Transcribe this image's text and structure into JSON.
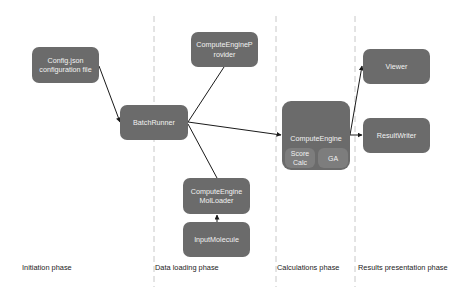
{
  "diagram": {
    "phases": [
      {
        "id": "initiation",
        "label": "Initiation phase"
      },
      {
        "id": "data-loading",
        "label": "Data loading phase"
      },
      {
        "id": "calculations",
        "label": "Calculations phase"
      },
      {
        "id": "results-presentation",
        "label": "Results presentation phase"
      }
    ],
    "nodes": {
      "config": {
        "line1": "Config.json",
        "line2": "configuration file"
      },
      "batch_runner": {
        "label": "BatchRunner"
      },
      "provider": {
        "line1": "ComputeEngineP",
        "line2": "rovider"
      },
      "compute_engine": {
        "label": "ComputeEngine",
        "sub1_line1": "Score",
        "sub1_line2": "Calc",
        "sub2": "GA"
      },
      "viewer": {
        "label": "Viewer"
      },
      "result_writer": {
        "label": "ResultWriter"
      },
      "mol_loader": {
        "line1": "ComputeEngine",
        "line2": "MolLoader"
      },
      "input_molecule": {
        "label": "InputMolecule"
      }
    },
    "edges": [
      {
        "from": "Config.json configuration file",
        "to": "BatchRunner"
      },
      {
        "from": "BatchRunner",
        "to": "ComputeEngineProvider"
      },
      {
        "from": "BatchRunner",
        "to": "ComputeEngine"
      },
      {
        "from": "BatchRunner",
        "to": "ComputeEngine MolLoader"
      },
      {
        "from": "InputMolecule",
        "to": "ComputeEngine MolLoader"
      },
      {
        "from": "ComputeEngine",
        "to": "Viewer"
      },
      {
        "from": "ComputeEngine",
        "to": "ResultWriter"
      }
    ],
    "colors": {
      "node_fill": "#6b6b6b",
      "subnode_fill": "#7d7d7d",
      "node_text": "#f2f2f2",
      "edge": "#1a1a1a",
      "divider": "#c8c8c8"
    }
  }
}
